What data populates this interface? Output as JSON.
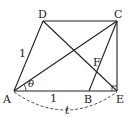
{
  "diagram": {
    "type": "geometry",
    "points": {
      "A": {
        "label": "A",
        "x": 14,
        "y": 91
      },
      "B": {
        "label": "B",
        "x": 89,
        "y": 91
      },
      "C": {
        "label": "C",
        "x": 117,
        "y": 21
      },
      "D": {
        "label": "D",
        "x": 43,
        "y": 21
      },
      "E": {
        "label": "E",
        "x": 117,
        "y": 91
      },
      "F": {
        "label": "F"
      }
    },
    "segments": [
      "AD",
      "DC",
      "CE",
      "AE",
      "AC",
      "DE",
      "BC"
    ],
    "annotations": {
      "AD_length": "1",
      "AB_length": "1",
      "angle_label": "θ",
      "arc_label": "t"
    },
    "right_angle_at": "E"
  }
}
